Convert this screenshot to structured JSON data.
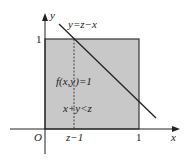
{
  "diagram": {
    "axes": {
      "x_label": "x",
      "y_label": "y",
      "origin_label": "O"
    },
    "ticks": {
      "x_one": "1",
      "y_one": "1",
      "x_z_minus_1": "z−1"
    },
    "line_label": "y=z−x",
    "region_labels": {
      "density": "f(x,y)=1",
      "inequality": "x+y<z"
    },
    "colors": {
      "region_fill": "#c8c8c8",
      "stroke": "#222222",
      "background": "#ffffff"
    }
  }
}
